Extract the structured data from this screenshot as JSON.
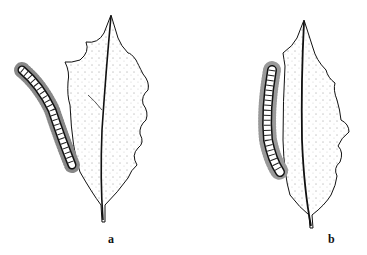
{
  "figure": {
    "panels": [
      {
        "id": "a",
        "label": "a",
        "description": "Holly leaf with caterpillar beside the leaf edge"
      },
      {
        "id": "b",
        "label": "b",
        "description": "Holly leaf with caterpillar resting along the leaf edge"
      }
    ],
    "colors": {
      "ink": "#111111",
      "background": "#ffffff"
    }
  }
}
